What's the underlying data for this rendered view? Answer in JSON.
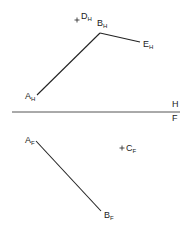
{
  "diagram": {
    "type": "descriptive-geometry-projection",
    "fold_line": {
      "upper_label": "H",
      "lower_label": "F",
      "x1": 12,
      "y1": 112,
      "x2": 180,
      "y2": 112
    },
    "horizontal_view": {
      "points": [
        {
          "id": "A_H",
          "base": "A",
          "sub": "H",
          "x": 37,
          "y": 95,
          "lx": 25,
          "ly": 99
        },
        {
          "id": "B_H",
          "base": "B",
          "sub": "H",
          "x": 100,
          "y": 33,
          "lx": 97,
          "ly": 26
        },
        {
          "id": "E_H",
          "base": "E",
          "sub": "H",
          "x": 140,
          "y": 42,
          "lx": 143,
          "ly": 47
        },
        {
          "id": "D_H",
          "base": "D",
          "sub": "H",
          "x": 77,
          "y": 20,
          "lx": 81,
          "ly": 19,
          "marker": "cross"
        }
      ],
      "segments": [
        [
          "A_H",
          "B_H"
        ],
        [
          "B_H",
          "E_H"
        ]
      ]
    },
    "frontal_view": {
      "points": [
        {
          "id": "A_F",
          "base": "A",
          "sub": "F",
          "x": 36,
          "y": 141,
          "lx": 25,
          "ly": 143
        },
        {
          "id": "B_F",
          "base": "B",
          "sub": "F",
          "x": 101,
          "y": 211,
          "lx": 104,
          "ly": 218
        },
        {
          "id": "C_F",
          "base": "C",
          "sub": "F",
          "x": 122,
          "y": 148,
          "lx": 126,
          "ly": 151,
          "marker": "cross"
        }
      ],
      "segments": [
        [
          "A_F",
          "B_F"
        ]
      ]
    },
    "colors": {
      "line": "#222222",
      "fold_line": "#555555",
      "background": "#ffffff"
    }
  }
}
